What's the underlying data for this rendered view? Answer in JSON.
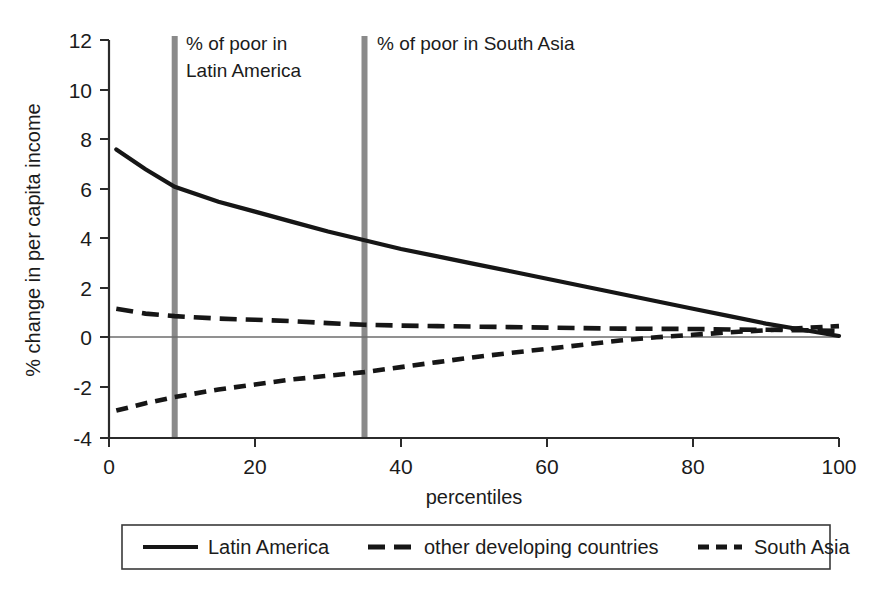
{
  "chart_data": {
    "type": "line",
    "title": "",
    "xlabel": "percentiles",
    "ylabel": "% change in per capita income",
    "xlim": [
      0,
      100
    ],
    "ylim": [
      -4,
      12
    ],
    "xticks": [
      0,
      20,
      40,
      60,
      80,
      100
    ],
    "yticks": [
      -4,
      -2,
      0,
      2,
      4,
      6,
      8,
      10,
      12
    ],
    "xtick_labels": [
      "0",
      "20",
      "40",
      "60",
      "80",
      "100"
    ],
    "ytick_labels": [
      "-4",
      "-2",
      "0",
      "2",
      "4",
      "6",
      "8",
      "10",
      "12"
    ],
    "grid": false,
    "zero_line": true,
    "legend_position": "below",
    "x": [
      1,
      5,
      9,
      15,
      20,
      25,
      30,
      35,
      40,
      45,
      50,
      55,
      60,
      65,
      70,
      75,
      80,
      85,
      90,
      95,
      100
    ],
    "series": [
      {
        "name": "Latin America",
        "style": "solid",
        "color": "#161616",
        "values": [
          7.6,
          6.8,
          6.1,
          5.5,
          5.1,
          4.7,
          4.3,
          3.95,
          3.6,
          3.3,
          3.0,
          2.7,
          2.4,
          2.1,
          1.8,
          1.5,
          1.2,
          0.9,
          0.6,
          0.35,
          0.1
        ]
      },
      {
        "name": "other developing countries",
        "style": "long-dash",
        "color": "#161616",
        "values": [
          1.2,
          1.0,
          0.9,
          0.8,
          0.75,
          0.7,
          0.62,
          0.55,
          0.52,
          0.5,
          0.48,
          0.46,
          0.44,
          0.42,
          0.4,
          0.39,
          0.38,
          0.36,
          0.35,
          0.33,
          0.3
        ]
      },
      {
        "name": "South Asia",
        "style": "short-dash",
        "color": "#161616",
        "values": [
          -2.9,
          -2.6,
          -2.35,
          -2.05,
          -1.85,
          -1.65,
          -1.5,
          -1.35,
          -1.15,
          -0.95,
          -0.75,
          -0.58,
          -0.42,
          -0.25,
          -0.08,
          0.05,
          0.15,
          0.25,
          0.33,
          0.42,
          0.5
        ]
      }
    ],
    "vertical_markers": [
      {
        "id": "latin-america-poor-marker",
        "x": 9,
        "label": "% of poor in\nLatin America",
        "label_line1": "% of poor in",
        "label_line2": "Latin America",
        "color": "#8a8a8a"
      },
      {
        "id": "south-asia-poor-marker",
        "x": 35,
        "label": "% of poor in South Asia",
        "label_line1": "% of poor in South Asia",
        "label_line2": "",
        "color": "#8a8a8a"
      }
    ],
    "legend": [
      {
        "label": "Latin America",
        "style": "solid"
      },
      {
        "label": "other developing countries",
        "style": "long-dash"
      },
      {
        "label": "South Asia",
        "style": "short-dash"
      }
    ]
  }
}
